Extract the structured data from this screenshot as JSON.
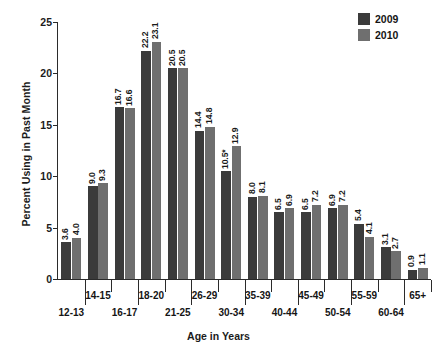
{
  "chart_data": {
    "type": "bar",
    "title": "",
    "xlabel": "Age in Years",
    "ylabel": "Percent Using in Past Month",
    "ylim": [
      0,
      25
    ],
    "yticks": [
      0,
      5,
      10,
      15,
      20,
      25
    ],
    "grid": false,
    "legend_position": "top-right",
    "categories": [
      "12-13",
      "14-15",
      "16-17",
      "18-20",
      "21-25",
      "26-29",
      "30-34",
      "35-39",
      "40-44",
      "45-49",
      "50-54",
      "55-59",
      "60-64",
      "65+"
    ],
    "series": [
      {
        "name": "2009",
        "color": "#3b3b3b",
        "values": [
          3.6,
          9.0,
          16.7,
          22.2,
          20.5,
          14.4,
          10.5,
          8.0,
          6.5,
          6.5,
          6.9,
          5.4,
          3.1,
          0.9
        ],
        "labels": [
          "3.6",
          "9.0",
          "16.7",
          "22.2",
          "20.5",
          "14.4",
          "10.5*",
          "8.0",
          "6.5",
          "6.5",
          "6.9",
          "5.4",
          "3.1",
          "0.9"
        ]
      },
      {
        "name": "2010",
        "color": "#6f6f6f",
        "values": [
          4.0,
          9.3,
          16.6,
          23.1,
          20.5,
          14.8,
          12.9,
          8.1,
          6.9,
          7.2,
          7.2,
          4.1,
          2.7,
          1.1
        ],
        "labels": [
          "4.0",
          "9.3",
          "16.6",
          "23.1",
          "20.5",
          "14.8",
          "12.9",
          "8.1",
          "6.9",
          "7.2",
          "7.2",
          "4.1",
          "2.7",
          "1.1"
        ]
      }
    ],
    "annotations": [
      "* Difference between estimate and 2010 estimate is statistically significant"
    ]
  },
  "legend": {
    "items": [
      {
        "label": "2009",
        "color": "#3b3b3b"
      },
      {
        "label": "2010",
        "color": "#6f6f6f"
      }
    ]
  },
  "axes": {
    "y_title": "Percent Using in Past Month",
    "x_title": "Age in Years",
    "y_ticklabels": [
      "0",
      "5",
      "10",
      "15",
      "20",
      "25"
    ]
  }
}
